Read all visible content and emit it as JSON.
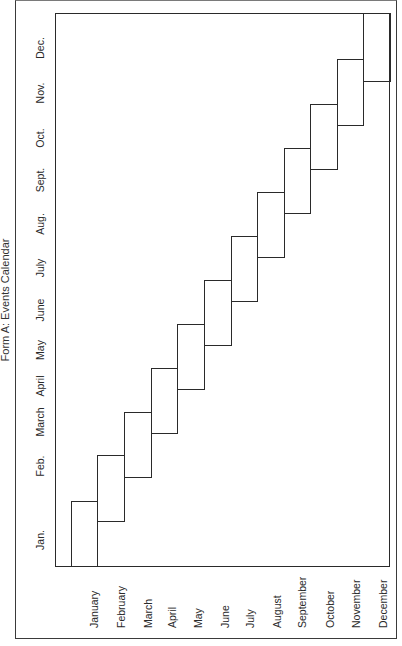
{
  "title": "Form A: Events Calendar",
  "left_axis_labels": [
    {
      "label": "Dec.",
      "y": 48
    },
    {
      "label": "Nov.",
      "y": 93
    },
    {
      "label": "Oct.",
      "y": 138
    },
    {
      "label": "Sept.",
      "y": 180
    },
    {
      "label": "Aug.",
      "y": 224
    },
    {
      "label": "July",
      "y": 268
    },
    {
      "label": "June",
      "y": 310
    },
    {
      "label": "May",
      "y": 350
    },
    {
      "label": "April",
      "y": 386
    },
    {
      "label": "March",
      "y": 422
    },
    {
      "label": "Feb.",
      "y": 466
    },
    {
      "label": "Jan.",
      "y": 540
    }
  ],
  "bottom_labels": [
    {
      "label": "January",
      "x": 94
    },
    {
      "label": "February",
      "x": 121
    },
    {
      "label": "March",
      "x": 148
    },
    {
      "label": "April",
      "x": 172
    },
    {
      "label": "May",
      "x": 198
    },
    {
      "label": "June",
      "x": 225
    },
    {
      "label": "July",
      "x": 250
    },
    {
      "label": "August",
      "x": 277
    },
    {
      "label": "September",
      "x": 302
    },
    {
      "label": "October",
      "x": 330
    },
    {
      "label": "November",
      "x": 356
    },
    {
      "label": "December",
      "x": 383
    }
  ],
  "steps": [
    {
      "month": "January",
      "x1": 71,
      "x2": 97,
      "top": 501,
      "bottom": 567
    },
    {
      "month": "February",
      "x1": 97,
      "x2": 124,
      "top": 455,
      "bottom": 522
    },
    {
      "month": "March",
      "x1": 124,
      "x2": 151,
      "top": 412,
      "bottom": 478
    },
    {
      "month": "April",
      "x1": 151,
      "x2": 177,
      "top": 368,
      "bottom": 434
    },
    {
      "month": "May",
      "x1": 177,
      "x2": 204,
      "top": 324,
      "bottom": 390
    },
    {
      "month": "June",
      "x1": 204,
      "x2": 231,
      "top": 280,
      "bottom": 346
    },
    {
      "month": "July",
      "x1": 231,
      "x2": 257,
      "top": 236,
      "bottom": 302
    },
    {
      "month": "August",
      "x1": 257,
      "x2": 284,
      "top": 192,
      "bottom": 258
    },
    {
      "month": "September",
      "x1": 284,
      "x2": 310,
      "top": 148,
      "bottom": 214
    },
    {
      "month": "October",
      "x1": 310,
      "x2": 337,
      "top": 104,
      "bottom": 170
    },
    {
      "month": "November",
      "x1": 337,
      "x2": 363,
      "top": 59,
      "bottom": 126
    },
    {
      "month": "December",
      "x1": 363,
      "x2": 390,
      "top": 13,
      "bottom": 82
    }
  ]
}
